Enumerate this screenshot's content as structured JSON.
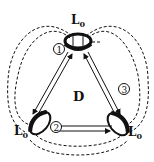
{
  "diagram": {
    "center_label": "D",
    "coils": [
      {
        "id": 1,
        "label": "L",
        "subscript": "0",
        "marker": "1",
        "position": "top"
      },
      {
        "id": 2,
        "label": "L",
        "subscript": "0",
        "marker": "2",
        "position": "bottom-left"
      },
      {
        "id": 3,
        "label": "L",
        "subscript": "0",
        "marker": "3",
        "position": "bottom-right"
      }
    ],
    "links": [
      {
        "from": 1,
        "to": 2,
        "type": "double-arrow"
      },
      {
        "from": 1,
        "to": 3,
        "type": "double-arrow"
      },
      {
        "from": 2,
        "to": 3,
        "type": "double-arrow"
      }
    ],
    "field_lines": "dashed",
    "colors": {
      "stroke": "#111111",
      "background": "#ffffff"
    }
  }
}
